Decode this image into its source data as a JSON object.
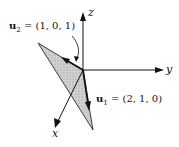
{
  "diagram": {
    "axes": {
      "x": {
        "label": "x"
      },
      "y": {
        "label": "y"
      },
      "z": {
        "label": "z"
      }
    },
    "vectors": [
      {
        "id": "u1",
        "name": "u",
        "subscript": "1",
        "value": "= (2, 1, 0)"
      },
      {
        "id": "u2",
        "name": "u",
        "subscript": "2",
        "value": "= (1, 0, 1)"
      }
    ],
    "colors": {
      "lines": "#111111",
      "triangle_fill": "#c8c8c8"
    }
  }
}
